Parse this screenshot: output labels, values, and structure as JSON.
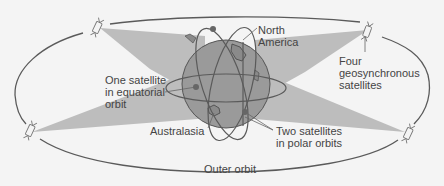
{
  "labels": {
    "north_america": [
      "North",
      "America"
    ],
    "geosync": [
      "Four",
      "geosynchronous",
      "satellites"
    ],
    "equatorial": [
      "One satellite",
      "in equatorial",
      "orbit"
    ],
    "australasia": "Australasia",
    "polar": [
      "Two satellites",
      "in polar orbits"
    ],
    "outer_orbit": "Outer orbit"
  },
  "colors": {
    "background": "#f4f4f4",
    "beam": "#bdbdbd",
    "globe": "#9a9a9a",
    "orbit_line": "#5a5a5a",
    "text": "#444444"
  }
}
